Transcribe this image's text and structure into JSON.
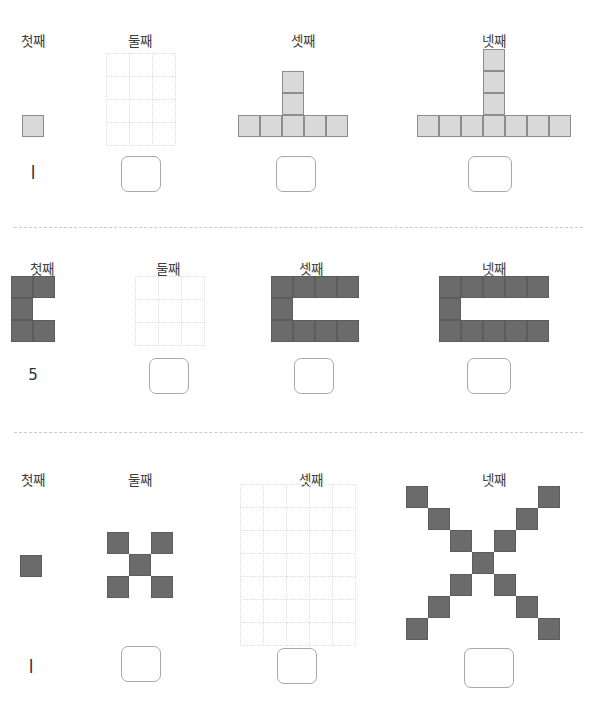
{
  "page": {
    "background_color": "#ffffff",
    "divider_color": "#c9c9cf",
    "cell_light_fill": "#d9d9d9",
    "cell_light_stroke": "#8d8d8d",
    "cell_dark_fill": "#6b6b6b",
    "cell_dark_stroke": "#5c5c5c",
    "blank_grid_stroke": "#dcdce2",
    "answer_box_stroke": "#a7a7ad"
  },
  "column_labels": {
    "first": "첫째",
    "second": "둘째",
    "third": "셋째",
    "fourth": "넷째"
  },
  "sections": [
    {
      "id": "section-1",
      "shape_style": "light",
      "cell_size": 22,
      "columns": [
        {
          "label": "첫째",
          "label_x": 33,
          "kind": "shape",
          "count_text": "l",
          "count_value": 1,
          "answer_box": false,
          "grid_cols": 1,
          "grid_rows": 1,
          "filled_cells": [
            [
              0,
              0
            ]
          ]
        },
        {
          "label": "둘째",
          "label_x": 140,
          "kind": "blank-grid",
          "count_text": "",
          "count_value": null,
          "answer_box": true,
          "grid_cols": 3,
          "grid_rows": 4,
          "filled_cells": []
        },
        {
          "label": "셋째",
          "label_x": 303,
          "kind": "shape",
          "count_text": "",
          "count_value": 7,
          "answer_box": true,
          "grid_cols": 5,
          "grid_rows": 3,
          "filled_cells": [
            [
              0,
              2
            ],
            [
              1,
              2
            ],
            [
              2,
              0
            ],
            [
              2,
              1
            ],
            [
              2,
              2
            ],
            [
              3,
              2
            ],
            [
              4,
              2
            ]
          ]
        },
        {
          "label": "넷째",
          "label_x": 494,
          "kind": "shape",
          "count_text": "",
          "count_value": 10,
          "answer_box": true,
          "grid_cols": 7,
          "grid_rows": 4,
          "filled_cells": [
            [
              0,
              3
            ],
            [
              1,
              3
            ],
            [
              2,
              3
            ],
            [
              3,
              0
            ],
            [
              3,
              1
            ],
            [
              3,
              2
            ],
            [
              3,
              3
            ],
            [
              4,
              3
            ],
            [
              5,
              3
            ],
            [
              6,
              3
            ]
          ]
        }
      ]
    },
    {
      "id": "section-2",
      "shape_style": "dark",
      "cell_size": 22,
      "columns": [
        {
          "label": "첫째",
          "label_x": 42,
          "kind": "shape",
          "count_text": "5",
          "count_value": 5,
          "answer_box": false,
          "grid_cols": 2,
          "grid_rows": 3,
          "filled_cells": [
            [
              0,
              0
            ],
            [
              1,
              0
            ],
            [
              0,
              1
            ],
            [
              0,
              2
            ],
            [
              1,
              2
            ]
          ]
        },
        {
          "label": "둘째",
          "label_x": 168,
          "kind": "blank-grid",
          "count_text": "",
          "count_value": null,
          "answer_box": true,
          "grid_cols": 3,
          "grid_rows": 3,
          "filled_cells": []
        },
        {
          "label": "셋째",
          "label_x": 311,
          "kind": "shape",
          "count_text": "",
          "count_value": 9,
          "answer_box": true,
          "grid_cols": 4,
          "grid_rows": 3,
          "filled_cells": [
            [
              0,
              0
            ],
            [
              1,
              0
            ],
            [
              2,
              0
            ],
            [
              3,
              0
            ],
            [
              0,
              1
            ],
            [
              0,
              2
            ],
            [
              1,
              2
            ],
            [
              2,
              2
            ],
            [
              3,
              2
            ]
          ]
        },
        {
          "label": "넷째",
          "label_x": 494,
          "kind": "shape",
          "count_text": "",
          "count_value": 11,
          "answer_box": true,
          "grid_cols": 5,
          "grid_rows": 3,
          "filled_cells": [
            [
              0,
              0
            ],
            [
              1,
              0
            ],
            [
              2,
              0
            ],
            [
              3,
              0
            ],
            [
              4,
              0
            ],
            [
              0,
              1
            ],
            [
              0,
              2
            ],
            [
              1,
              2
            ],
            [
              2,
              2
            ],
            [
              3,
              2
            ],
            [
              4,
              2
            ]
          ]
        }
      ]
    },
    {
      "id": "section-3",
      "shape_style": "dark",
      "cell_size": 22,
      "columns": [
        {
          "label": "첫째",
          "label_x": 33,
          "kind": "shape",
          "count_text": "l",
          "count_value": 1,
          "answer_box": false,
          "grid_cols": 1,
          "grid_rows": 1,
          "filled_cells": [
            [
              0,
              0
            ]
          ]
        },
        {
          "label": "둘째",
          "label_x": 140,
          "kind": "shape",
          "count_text": "",
          "count_value": 5,
          "answer_box": true,
          "grid_cols": 3,
          "grid_rows": 3,
          "filled_cells": [
            [
              0,
              0
            ],
            [
              2,
              0
            ],
            [
              1,
              1
            ],
            [
              0,
              2
            ],
            [
              2,
              2
            ]
          ]
        },
        {
          "label": "셋째",
          "label_x": 311,
          "kind": "blank-grid",
          "count_text": "",
          "count_value": null,
          "answer_box": true,
          "grid_cols": 5,
          "grid_rows": 7,
          "filled_cells": []
        },
        {
          "label": "넷째",
          "label_x": 494,
          "kind": "shape",
          "count_text": "",
          "count_value": 13,
          "answer_box": true,
          "grid_cols": 7,
          "grid_rows": 7,
          "filled_cells": [
            [
              0,
              0
            ],
            [
              6,
              0
            ],
            [
              1,
              1
            ],
            [
              5,
              1
            ],
            [
              2,
              2
            ],
            [
              4,
              2
            ],
            [
              3,
              3
            ],
            [
              2,
              4
            ],
            [
              4,
              4
            ],
            [
              1,
              5
            ],
            [
              5,
              5
            ],
            [
              0,
              6
            ],
            [
              6,
              6
            ]
          ]
        }
      ]
    }
  ]
}
